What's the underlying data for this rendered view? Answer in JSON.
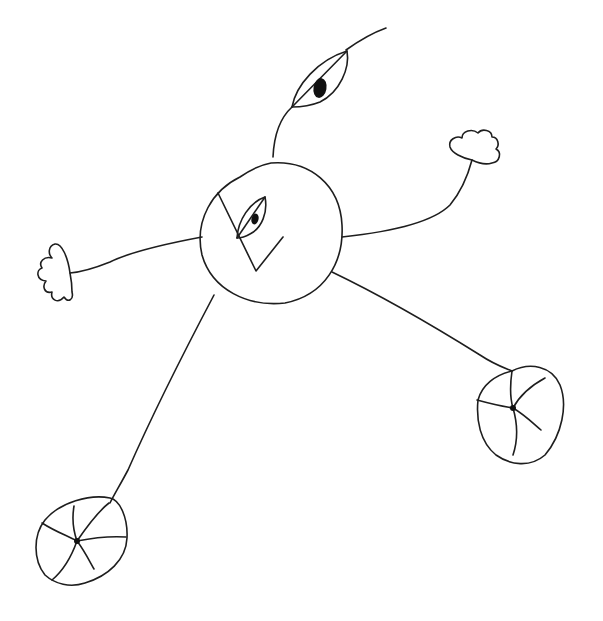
{
  "drawing": {
    "description": "Hand-drawn creature sketch: round body with one eye and a V-shaped mark, an eye on a stalk above, two small cloud-like hands on arms, two long legs ending in wheel-like feet",
    "ink_color": "#1e1e1e",
    "background": "#ffffff",
    "parts": [
      {
        "name": "body",
        "shape": "circle"
      },
      {
        "name": "body-eye",
        "shape": "almond-eye"
      },
      {
        "name": "v-mark",
        "shape": "v-line"
      },
      {
        "name": "stalk-eye",
        "shape": "almond-eye"
      },
      {
        "name": "left-hand",
        "shape": "cloud"
      },
      {
        "name": "right-hand",
        "shape": "cloud"
      },
      {
        "name": "left-foot",
        "shape": "wheel"
      },
      {
        "name": "right-foot",
        "shape": "wheel"
      }
    ]
  }
}
